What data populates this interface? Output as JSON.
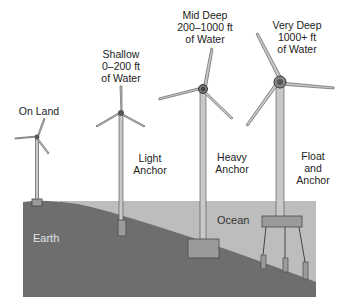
{
  "diagram": {
    "colors": {
      "earth": "#6e6e6e",
      "ocean": "#bdbdbd",
      "tower": "#c8c8c8",
      "outline": "#4a4a4a",
      "anchor": "#9a9a9a"
    },
    "regions": {
      "earth": "Earth",
      "ocean": "Ocean"
    },
    "turbines": [
      {
        "id": "on-land",
        "heading": [
          "On Land"
        ],
        "foundation": []
      },
      {
        "id": "shallow",
        "heading": [
          "Shallow",
          "0–200 ft",
          "of Water"
        ],
        "foundation": [
          "Light",
          "Anchor"
        ]
      },
      {
        "id": "mid-deep",
        "heading": [
          "Mid Deep",
          "200–1000 ft",
          "of Water"
        ],
        "foundation": [
          "Heavy",
          "Anchor"
        ]
      },
      {
        "id": "very-deep",
        "heading": [
          "Very Deep",
          "1000+ ft",
          "of Water"
        ],
        "foundation": [
          "Float",
          "and",
          "Anchor"
        ]
      }
    ]
  }
}
